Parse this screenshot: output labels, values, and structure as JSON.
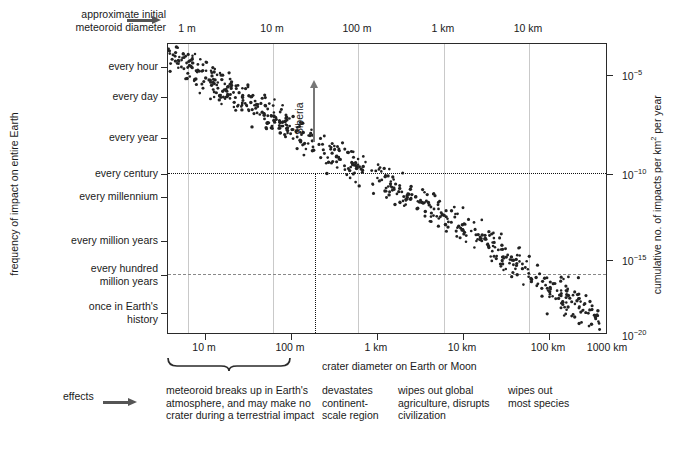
{
  "top_axis": {
    "caption_line1": "approximate initial",
    "caption_line2": "meteoroid diameter",
    "arrow_icon": "arrow-right-icon",
    "ticks": [
      {
        "label": "1 m",
        "x": 187
      },
      {
        "label": "10 m",
        "x": 272
      },
      {
        "label": "100 m",
        "x": 357
      },
      {
        "label": "1 km",
        "x": 443
      },
      {
        "label": "10 km",
        "x": 528
      }
    ]
  },
  "left_axis": {
    "title": "frequency of impact on entire Earth",
    "ticks": [
      {
        "label": "every hour",
        "y": 66
      },
      {
        "label": "every day",
        "y": 96
      },
      {
        "label": "every year",
        "y": 137
      },
      {
        "label": "every century",
        "y": 173
      },
      {
        "label": "every millennium",
        "y": 196
      },
      {
        "label": "every million years",
        "y": 240
      },
      {
        "label": "every hundred",
        "label2": "million years",
        "y": 274
      },
      {
        "label": "once in Earth's",
        "label2": "history",
        "y": 312
      }
    ]
  },
  "right_axis": {
    "title_pre": "cumulative no. of impacts per km",
    "title_sup": "2",
    "title_post": " per year",
    "ticks": [
      {
        "mantissa": "10",
        "exponent": "−5",
        "y": 74
      },
      {
        "mantissa": "10",
        "exponent": "−10",
        "y": 173
      },
      {
        "mantissa": "10",
        "exponent": "−15",
        "y": 259
      },
      {
        "mantissa": "10",
        "exponent": "−20",
        "y": 334
      }
    ]
  },
  "bottom_axis": {
    "title": "crater diameter on Earth or Moon",
    "ticks": [
      {
        "label": "10 m",
        "x": 204
      },
      {
        "label": "100 m",
        "x": 290
      },
      {
        "label": "1 km",
        "x": 376
      },
      {
        "label": "10 km",
        "x": 462
      },
      {
        "label": "100 km",
        "x": 548
      },
      {
        "label": "1000 km",
        "x": 607
      }
    ]
  },
  "annotations": {
    "siberia_label": "Siberia",
    "siberia_arrow_icon": "arrow-up-icon",
    "century_dotted_line": "every century reference line",
    "hundred_million_dashed_line": "every hundred million years reference line"
  },
  "effects_row": {
    "label": "effects",
    "arrow_icon": "arrow-right-icon",
    "items": [
      {
        "lines": [
          "meteoroid breaks up in Earth's",
          "atmosphere, and may make no",
          "crater during a terrestrial impact"
        ],
        "x": 166,
        "width": 190
      },
      {
        "lines": [
          "devastates",
          "continent-",
          "scale region"
        ],
        "x": 322,
        "width": 80
      },
      {
        "lines": [
          "wipes out global",
          "agriculture, disrupts",
          "civilization"
        ],
        "x": 398,
        "width": 110
      },
      {
        "lines": [
          "wipes out",
          "most species"
        ],
        "x": 508,
        "width": 90
      }
    ]
  },
  "chart_data": {
    "type": "scatter",
    "title": "",
    "xlabel": "crater diameter on Earth or Moon",
    "ylabel": "frequency of impact on entire Earth",
    "ylabel_right": "cumulative no. of impacts per km2 per year",
    "xlabel_top": "approximate initial meteoroid diameter",
    "grid": true,
    "legend": "none",
    "x_scale": "log",
    "y_scale": "log",
    "x_ticks": [
      "10 m",
      "100 m",
      "1 km",
      "10 km",
      "100 km",
      "1000 km"
    ],
    "x_ticks_top": [
      "1 m",
      "10 m",
      "100 m",
      "1 km",
      "10 km"
    ],
    "y_ticks_left": [
      "every hour",
      "every day",
      "every year",
      "every century",
      "every millennium",
      "every million years",
      "every hundred million years",
      "once in Earth's history"
    ],
    "y_ticks_right": [
      "1e-5",
      "1e-10",
      "1e-15",
      "1e-20"
    ],
    "trend": {
      "slope_note": "frequency decreases roughly as a power law with crater diameter"
    },
    "reference_lines": [
      {
        "orientation": "horizontal",
        "style": "dotted",
        "at": "every century / 1e-10"
      },
      {
        "orientation": "horizontal",
        "style": "dashed",
        "at": "every hundred million years / ~1e-15"
      },
      {
        "orientation": "vertical",
        "style": "dotted",
        "at": "Siberia event, ~300 m crater"
      }
    ],
    "points_seed": 20240607,
    "n_points": 560
  }
}
